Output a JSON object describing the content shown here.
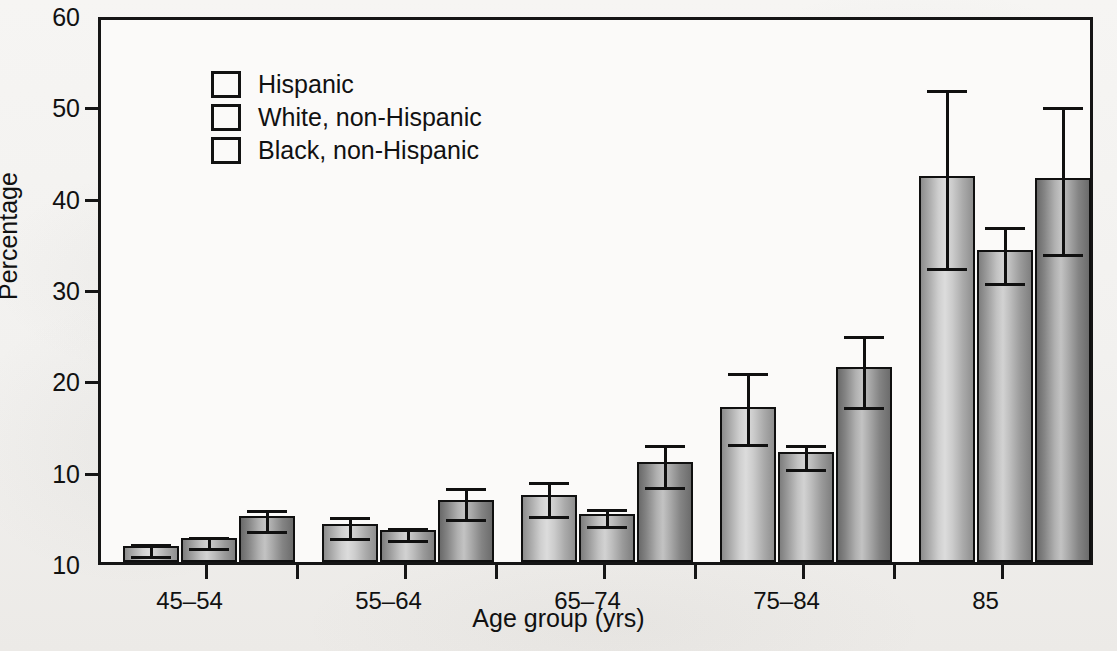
{
  "chart_data": {
    "type": "bar",
    "title": "",
    "xlabel": "Age group (yrs)",
    "ylabel": "Percentage",
    "categories": [
      "45–54",
      "55–64",
      "65–74",
      "75–84",
      "85"
    ],
    "ylim": [
      0,
      60
    ],
    "ytick_labels": [
      "10",
      "10",
      "20",
      "30",
      "40",
      "50",
      "60"
    ],
    "ytick_values": [
      0,
      10,
      20,
      30,
      40,
      50,
      60
    ],
    "grid": false,
    "legend_position": "top-left",
    "error_bars": "95% confidence interval",
    "series": [
      {
        "name": "Hispanic",
        "values": [
          1.8,
          4.2,
          7.3,
          17.0,
          42.3
        ],
        "ci_low": [
          1.2,
          3.1,
          5.5,
          13.4,
          32.7
        ],
        "ci_high": [
          2.5,
          5.4,
          9.2,
          21.2,
          52.2
        ]
      },
      {
        "name": "White, non-Hispanic",
        "values": [
          2.6,
          3.5,
          5.3,
          12.0,
          34.2
        ],
        "ci_low": [
          2.0,
          2.9,
          4.4,
          10.7,
          31.0
        ],
        "ci_high": [
          3.2,
          4.2,
          6.3,
          13.3,
          37.2
        ]
      },
      {
        "name": "Black, non-Hispanic",
        "values": [
          5.0,
          6.8,
          10.9,
          21.3,
          42.0
        ],
        "ci_low": [
          3.9,
          5.2,
          8.7,
          17.5,
          34.2
        ],
        "ci_high": [
          6.2,
          8.6,
          13.3,
          25.2,
          50.3
        ]
      }
    ]
  },
  "legend": {
    "items": [
      {
        "label": "Hispanic"
      },
      {
        "label": "White, non-Hispanic"
      },
      {
        "label": "Black, non-Hispanic"
      }
    ]
  },
  "colors": {
    "axis": "#151515",
    "text": "#111111",
    "page_background": "#f4f3f1",
    "plot_background": "#fbfaf9"
  }
}
